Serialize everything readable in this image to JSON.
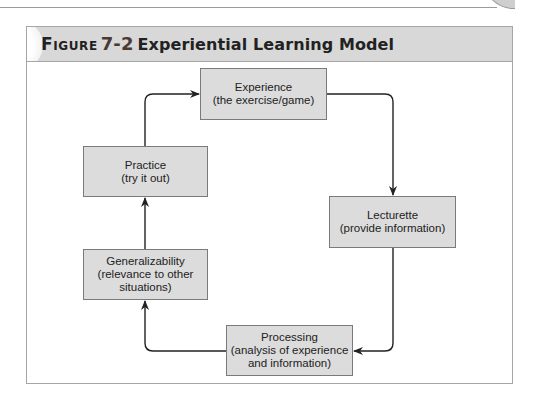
{
  "figure": {
    "label": "Figure",
    "number": "7-2",
    "title": "Experiential Learning Model"
  },
  "diagram": {
    "type": "cycle",
    "nodes": [
      {
        "id": "experience",
        "title": "Experience",
        "subtitle": "(the exercise/game)"
      },
      {
        "id": "lecturette",
        "title": "Lecturette",
        "subtitle": "(provide information)"
      },
      {
        "id": "processing",
        "title": "Processing",
        "subtitle_line1": "(analysis of experience",
        "subtitle_line2": "and information)"
      },
      {
        "id": "generalizability",
        "title": "Generalizability",
        "subtitle_line1": "(relevance to other",
        "subtitle_line2": "situations)"
      },
      {
        "id": "practice",
        "title": "Practice",
        "subtitle": "(try it out)"
      }
    ],
    "edges": [
      {
        "from": "experience",
        "to": "lecturette"
      },
      {
        "from": "lecturette",
        "to": "processing"
      },
      {
        "from": "processing",
        "to": "generalizability"
      },
      {
        "from": "generalizability",
        "to": "practice"
      },
      {
        "from": "practice",
        "to": "experience"
      }
    ]
  }
}
